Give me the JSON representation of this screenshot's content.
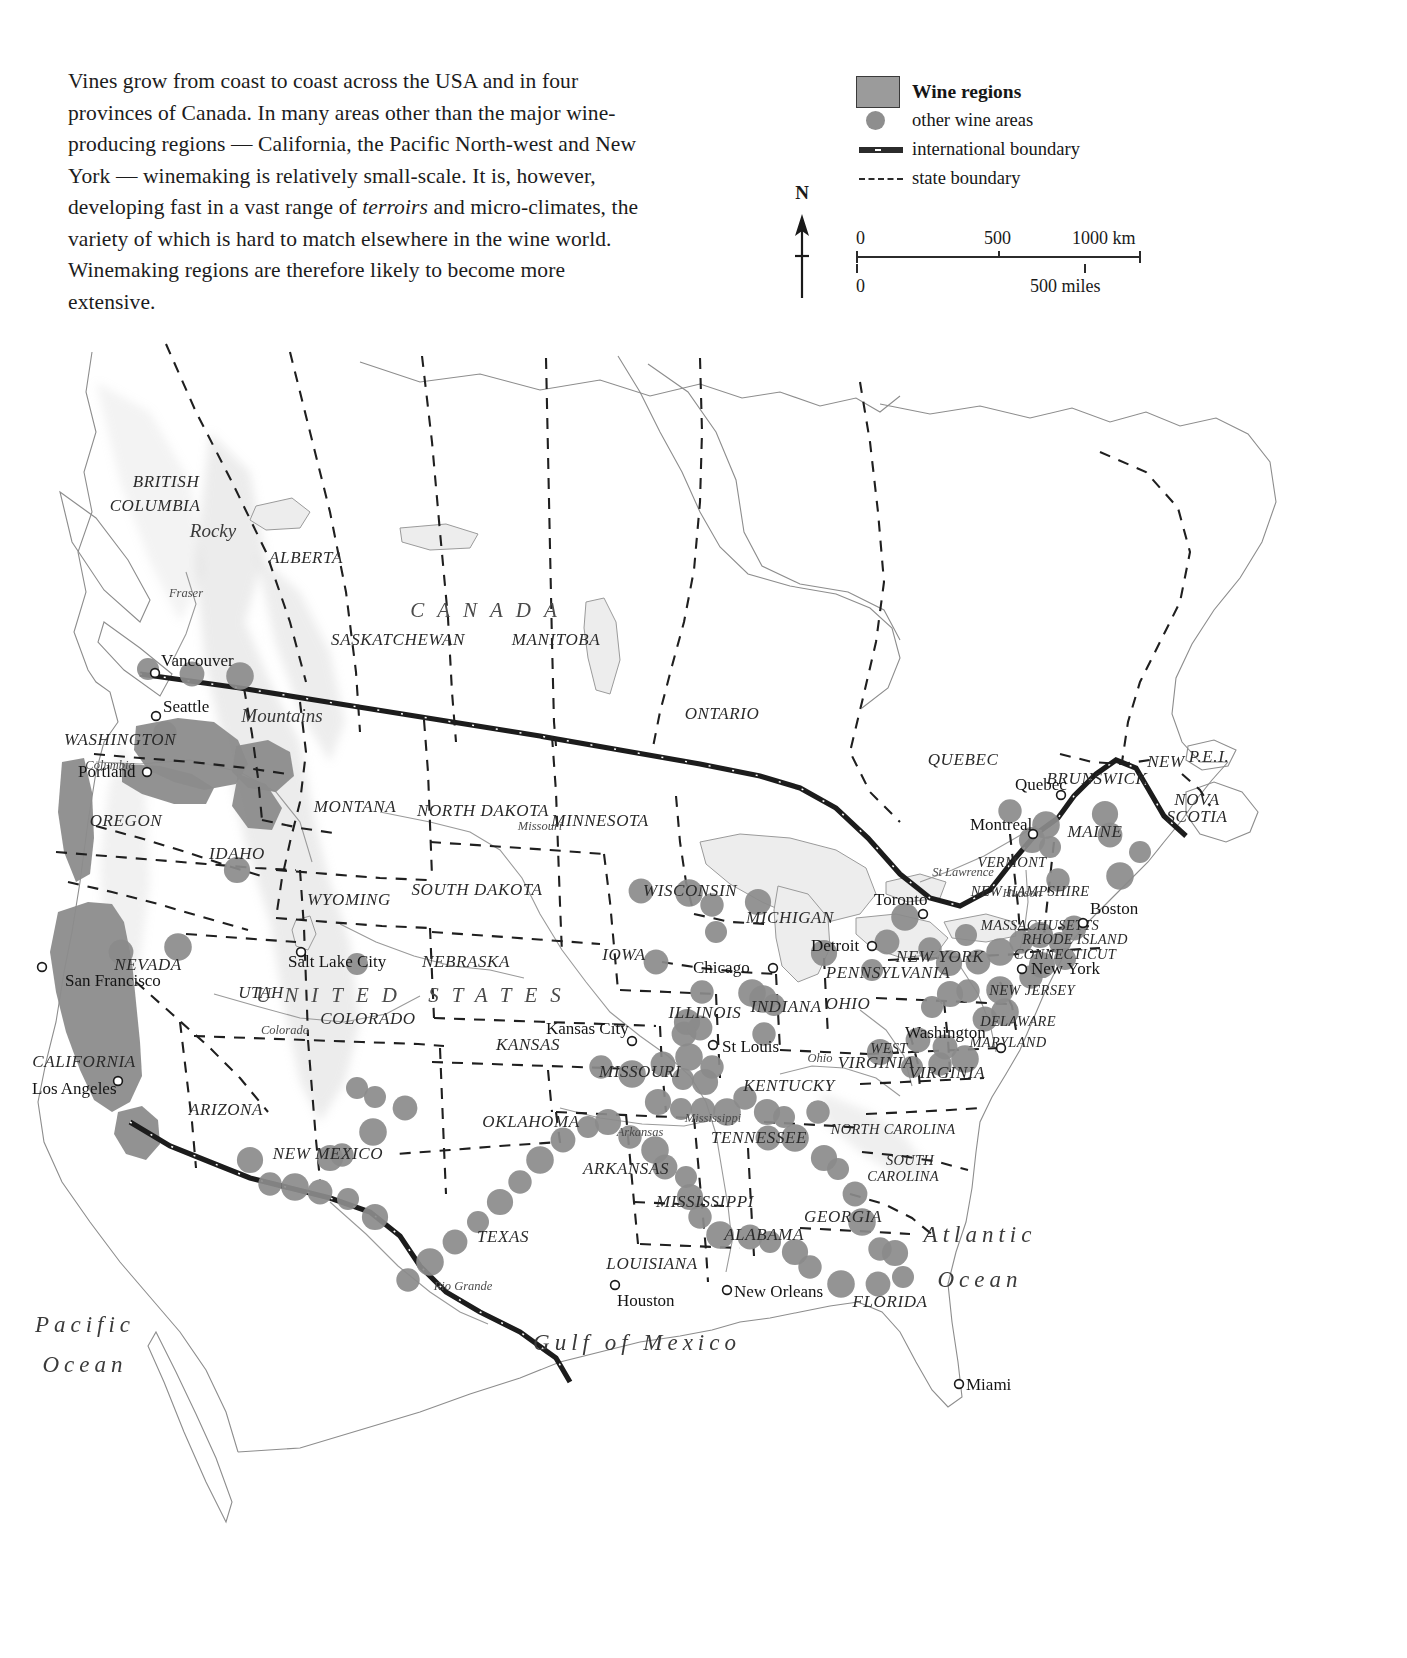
{
  "intro": {
    "part1": "Vines grow from coast to coast across the USA and in four provinces of Canada. In many areas other than the major wine-producing regions — California, the Pacific North-west and New York — winemaking is relatively small-scale. It is, however, developing fast in a vast range of ",
    "italic": "terroirs",
    "part2": " and micro-climates, the variety of which is hard to match elsewhere in the wine world. Winemaking regions are therefore likely to become more extensive."
  },
  "legend": {
    "title": "Wine regions",
    "items": [
      {
        "key": "wine-regions-swatch",
        "label": "Wine regions"
      },
      {
        "key": "other-wine-areas-dot",
        "label": "other wine areas"
      },
      {
        "key": "international-boundary-line",
        "label": "international boundary"
      },
      {
        "key": "state-boundary-line",
        "label": "state boundary"
      }
    ]
  },
  "compass": {
    "north_label": "N"
  },
  "scalebar": {
    "km": {
      "ticks": [
        "0",
        "500",
        "1000 km"
      ]
    },
    "miles": {
      "ticks": [
        "0",
        "500 miles"
      ]
    }
  },
  "map": {
    "countries": [
      {
        "name": "CANADA",
        "x": 490,
        "y": 295
      },
      {
        "name": "UNITED   STATES",
        "x": 415,
        "y": 680
      }
    ],
    "oceans": [
      {
        "name": "Pacific",
        "x": 85,
        "y": 1010
      },
      {
        "name": "Ocean",
        "x": 85,
        "y": 1050
      },
      {
        "name": "Atlantic",
        "x": 980,
        "y": 920
      },
      {
        "name": "Ocean",
        "x": 980,
        "y": 965
      },
      {
        "name": "Gulf of Mexico",
        "x": 637,
        "y": 1028
      }
    ],
    "provinces": [
      {
        "name": "BRITISH",
        "x": 166,
        "y": 165
      },
      {
        "name": "COLUMBIA",
        "x": 155,
        "y": 189
      },
      {
        "name": "ALBERTA",
        "x": 306,
        "y": 241
      },
      {
        "name": "SASKATCHEWAN",
        "x": 398,
        "y": 323
      },
      {
        "name": "MANITOBA",
        "x": 556,
        "y": 323
      },
      {
        "name": "ONTARIO",
        "x": 722,
        "y": 397
      },
      {
        "name": "QUEBEC",
        "x": 963,
        "y": 443
      },
      {
        "name": "NEW",
        "x": 1166,
        "y": 445
      },
      {
        "name": "BRUNSWICK",
        "x": 1097,
        "y": 462
      },
      {
        "name": "P.E.I.",
        "x": 1209,
        "y": 440
      },
      {
        "name": "NOVA",
        "x": 1197,
        "y": 483
      },
      {
        "name": "SCOTIA",
        "x": 1197,
        "y": 500
      }
    ],
    "states": [
      {
        "name": "WASHINGTON",
        "x": 120,
        "y": 423
      },
      {
        "name": "OREGON",
        "x": 126,
        "y": 504
      },
      {
        "name": "IDAHO",
        "x": 237,
        "y": 537
      },
      {
        "name": "MONTANA",
        "x": 355,
        "y": 490
      },
      {
        "name": "NORTH DAKOTA",
        "x": 483,
        "y": 494
      },
      {
        "name": "MINNESOTA",
        "x": 600,
        "y": 504
      },
      {
        "name": "SOUTH DAKOTA",
        "x": 477,
        "y": 573
      },
      {
        "name": "WYOMING",
        "x": 349,
        "y": 583
      },
      {
        "name": "WISCONSIN",
        "x": 690,
        "y": 574
      },
      {
        "name": "MICHIGAN",
        "x": 790,
        "y": 601
      },
      {
        "name": "NEVADA",
        "x": 148,
        "y": 648
      },
      {
        "name": "UTAH",
        "x": 261,
        "y": 676
      },
      {
        "name": "NEBRASKA",
        "x": 466,
        "y": 645
      },
      {
        "name": "IOWA",
        "x": 624,
        "y": 638
      },
      {
        "name": "COLORADO",
        "x": 368,
        "y": 702
      },
      {
        "name": "KANSAS",
        "x": 528,
        "y": 728
      },
      {
        "name": "MISSOURI",
        "x": 640,
        "y": 755
      },
      {
        "name": "ILLINOIS",
        "x": 705,
        "y": 696
      },
      {
        "name": "INDIANA",
        "x": 786,
        "y": 690
      },
      {
        "name": "OHIO",
        "x": 848,
        "y": 687
      },
      {
        "name": "PENNSYLVANIA",
        "x": 888,
        "y": 656
      },
      {
        "name": "NEW YORK",
        "x": 940,
        "y": 640
      },
      {
        "name": "CALIFORNIA",
        "x": 84,
        "y": 745
      },
      {
        "name": "ARIZONA",
        "x": 226,
        "y": 793
      },
      {
        "name": "NEW MEXICO",
        "x": 328,
        "y": 837
      },
      {
        "name": "OKLAHOMA",
        "x": 531,
        "y": 805
      },
      {
        "name": "ARKANSAS",
        "x": 626,
        "y": 852
      },
      {
        "name": "TEXAS",
        "x": 503,
        "y": 920
      },
      {
        "name": "LOUISIANA",
        "x": 652,
        "y": 947
      },
      {
        "name": "MISSISSIPPI",
        "x": 705,
        "y": 885
      },
      {
        "name": "ALABAMA",
        "x": 764,
        "y": 918
      },
      {
        "name": "TENNESSEE",
        "x": 759,
        "y": 821
      },
      {
        "name": "KENTUCKY",
        "x": 789,
        "y": 769
      },
      {
        "name": "WEST",
        "x": 889,
        "y": 731
      },
      {
        "name": "VIRGINIA",
        "x": 876,
        "y": 746
      },
      {
        "name": "VIRGINIA",
        "x": 947,
        "y": 756
      },
      {
        "name": "NORTH CAROLINA",
        "x": 893,
        "y": 812
      },
      {
        "name": "SOUTH",
        "x": 910,
        "y": 843
      },
      {
        "name": "CAROLINA",
        "x": 903,
        "y": 859
      },
      {
        "name": "GEORGIA",
        "x": 843,
        "y": 900
      },
      {
        "name": "FLORIDA",
        "x": 890,
        "y": 985
      },
      {
        "name": "MAINE",
        "x": 1095,
        "y": 515
      },
      {
        "name": "VERMONT",
        "x": 1012,
        "y": 545
      },
      {
        "name": "NEW HAMPSHIRE",
        "x": 1030,
        "y": 574
      },
      {
        "name": "MASSACHUSETTS",
        "x": 1040,
        "y": 608
      },
      {
        "name": "RHODE ISLAND",
        "x": 1075,
        "y": 622
      },
      {
        "name": "CONNECTICUT",
        "x": 1065,
        "y": 637
      },
      {
        "name": "NEW JERSEY",
        "x": 1032,
        "y": 673
      },
      {
        "name": "DELAWARE",
        "x": 1018,
        "y": 704
      },
      {
        "name": "MARYLAND",
        "x": 1008,
        "y": 725
      }
    ],
    "cities": [
      {
        "name": "Vancouver",
        "lx": 161,
        "ly": 344,
        "dx": 155,
        "dy": 351
      },
      {
        "name": "Seattle",
        "lx": 163,
        "ly": 390,
        "dx": 156,
        "dy": 394
      },
      {
        "name": "Portland",
        "lx": 78,
        "ly": 455,
        "dx": 147,
        "dy": 450
      },
      {
        "name": "San Francisco",
        "lx": 65,
        "ly": 664,
        "dx": 42,
        "dy": 645
      },
      {
        "name": "Los Angeles",
        "lx": 32,
        "ly": 772,
        "dx": 118,
        "dy": 759
      },
      {
        "name": "Salt Lake City",
        "lx": 288,
        "ly": 645,
        "dx": 301,
        "dy": 630
      },
      {
        "name": "Kansas City",
        "lx": 546,
        "ly": 712,
        "dx": 632,
        "dy": 719
      },
      {
        "name": "St Louis",
        "lx": 722,
        "ly": 730,
        "dx": 713,
        "dy": 723
      },
      {
        "name": "Chicago",
        "lx": 693,
        "ly": 651,
        "dx": 773,
        "dy": 646
      },
      {
        "name": "Detroit",
        "lx": 811,
        "ly": 629,
        "dx": 872,
        "dy": 624
      },
      {
        "name": "Toronto",
        "lx": 874,
        "ly": 583,
        "dx": 923,
        "dy": 592
      },
      {
        "name": "Montreal",
        "lx": 970,
        "ly": 508,
        "dx": 1033,
        "dy": 512
      },
      {
        "name": "Quebec",
        "lx": 1015,
        "ly": 468,
        "dx": 1061,
        "dy": 473
      },
      {
        "name": "Boston",
        "lx": 1090,
        "ly": 592,
        "dx": 1083,
        "dy": 601
      },
      {
        "name": "New York",
        "lx": 1031,
        "ly": 652,
        "dx": 1022,
        "dy": 647
      },
      {
        "name": "Washington",
        "lx": 905,
        "ly": 716,
        "dx": 1001,
        "dy": 726
      },
      {
        "name": "New Orleans",
        "lx": 734,
        "ly": 975,
        "dx": 727,
        "dy": 968
      },
      {
        "name": "Houston",
        "lx": 617,
        "ly": 984,
        "dx": 615,
        "dy": 963
      },
      {
        "name": "Miami",
        "lx": 966,
        "ly": 1068,
        "dx": 959,
        "dy": 1062
      }
    ],
    "rivers": [
      {
        "name": "Fraser",
        "x": 186,
        "y": 275
      },
      {
        "name": "Columbia",
        "x": 110,
        "y": 447
      },
      {
        "name": "Missouri",
        "x": 540,
        "y": 508
      },
      {
        "name": "Mississippi",
        "x": 713,
        "y": 800
      },
      {
        "name": "Arkansas",
        "x": 640,
        "y": 814
      },
      {
        "name": "Ohio",
        "x": 820,
        "y": 740
      },
      {
        "name": "Colorado",
        "x": 285,
        "y": 712
      },
      {
        "name": "Rio Grande",
        "x": 463,
        "y": 968
      },
      {
        "name": "St Lawrence",
        "x": 963,
        "y": 554
      },
      {
        "name": "Hudson",
        "x": 1022,
        "y": 575
      }
    ],
    "ranges": [
      {
        "name": "Rocky",
        "x": 213,
        "y": 215
      },
      {
        "name": "Mountains",
        "x": 282,
        "y": 400
      }
    ]
  },
  "colors": {
    "wine_region_fill": "#8c8c8c",
    "wine_dot_fill": "#8b8b8b",
    "boundary_international": "#1c1c1c",
    "boundary_state": "#1f1f1f",
    "lake_fill": "#ededed",
    "text": "#1f1f1f",
    "background": "#ffffff"
  },
  "chart_data": {
    "type": "map",
    "wine_dots": [
      [
        148,
        347
      ],
      [
        192,
        352
      ],
      [
        240,
        354
      ],
      [
        165,
        411
      ],
      [
        237,
        548
      ],
      [
        357,
        642
      ],
      [
        641,
        569
      ],
      [
        689,
        571
      ],
      [
        712,
        583
      ],
      [
        758,
        580
      ],
      [
        716,
        610
      ],
      [
        656,
        640
      ],
      [
        752,
        671
      ],
      [
        702,
        670
      ],
      [
        687,
        700
      ],
      [
        774,
        683
      ],
      [
        684,
        712
      ],
      [
        763,
        677
      ],
      [
        764,
        712
      ],
      [
        824,
        631
      ],
      [
        872,
        648
      ],
      [
        887,
        620
      ],
      [
        905,
        595
      ],
      [
        930,
        627
      ],
      [
        949,
        641
      ],
      [
        966,
        613
      ],
      [
        978,
        640
      ],
      [
        1000,
        630
      ],
      [
        1021,
        620
      ],
      [
        1040,
        613
      ],
      [
        1060,
        621
      ],
      [
        1074,
        606
      ],
      [
        1000,
        668
      ],
      [
        968,
        669
      ],
      [
        950,
        672
      ],
      [
        932,
        685
      ],
      [
        985,
        697
      ],
      [
        1005,
        690
      ],
      [
        1031,
        655
      ],
      [
        1042,
        643
      ],
      [
        1065,
        637
      ],
      [
        918,
        718
      ],
      [
        965,
        737
      ],
      [
        940,
        742
      ],
      [
        880,
        730
      ],
      [
        912,
        745
      ],
      [
        945,
        725
      ],
      [
        1046,
        503
      ],
      [
        1010,
        489
      ],
      [
        1032,
        518
      ],
      [
        1050,
        525
      ],
      [
        1110,
        513
      ],
      [
        1120,
        554
      ],
      [
        1058,
        558
      ],
      [
        1105,
        492
      ],
      [
        1140,
        530
      ],
      [
        700,
        706
      ],
      [
        689,
        735
      ],
      [
        712,
        745
      ],
      [
        705,
        760
      ],
      [
        683,
        757
      ],
      [
        663,
        742
      ],
      [
        632,
        752
      ],
      [
        601,
        745
      ],
      [
        658,
        780
      ],
      [
        681,
        787
      ],
      [
        703,
        788
      ],
      [
        727,
        790
      ],
      [
        745,
        776
      ],
      [
        767,
        790
      ],
      [
        784,
        795
      ],
      [
        768,
        816
      ],
      [
        795,
        816
      ],
      [
        818,
        790
      ],
      [
        824,
        836
      ],
      [
        838,
        847
      ],
      [
        855,
        872
      ],
      [
        862,
        900
      ],
      [
        880,
        927
      ],
      [
        895,
        931
      ],
      [
        903,
        955
      ],
      [
        878,
        962
      ],
      [
        841,
        962
      ],
      [
        810,
        945
      ],
      [
        795,
        930
      ],
      [
        770,
        920
      ],
      [
        750,
        915
      ],
      [
        720,
        913
      ],
      [
        700,
        895
      ],
      [
        690,
        875
      ],
      [
        686,
        855
      ],
      [
        665,
        845
      ],
      [
        655,
        828
      ],
      [
        630,
        815
      ],
      [
        608,
        800
      ],
      [
        588,
        805
      ],
      [
        563,
        818
      ],
      [
        540,
        838
      ],
      [
        520,
        860
      ],
      [
        500,
        880
      ],
      [
        478,
        900
      ],
      [
        455,
        920
      ],
      [
        430,
        940
      ],
      [
        408,
        958
      ],
      [
        375,
        895
      ],
      [
        348,
        877
      ],
      [
        320,
        870
      ],
      [
        295,
        865
      ],
      [
        270,
        862
      ],
      [
        250,
        838
      ],
      [
        375,
        775
      ],
      [
        405,
        786
      ],
      [
        373,
        810
      ],
      [
        342,
        833
      ],
      [
        330,
        836
      ],
      [
        357,
        766
      ],
      [
        121,
        630
      ],
      [
        178,
        625
      ]
    ]
  }
}
